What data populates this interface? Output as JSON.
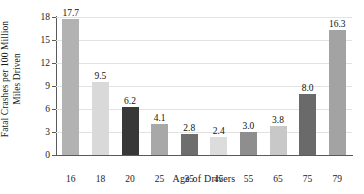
{
  "chart_data": {
    "type": "bar",
    "title": "",
    "xlabel": "Age of Drivers",
    "ylabel": "Fatal Crashes per 100 Million Miles Driven",
    "ylabel_line1": "Fatal Crashes per 100 Million",
    "ylabel_line2": "Miles Driven",
    "categories": [
      "16",
      "18",
      "20",
      "25",
      "35",
      "45",
      "55",
      "65",
      "75",
      "79"
    ],
    "values": [
      17.7,
      9.5,
      6.2,
      4.1,
      2.8,
      2.4,
      3.0,
      3.8,
      8.0,
      16.3
    ],
    "value_labels": [
      "17.7",
      "9.5",
      "6.2",
      "4.1",
      "2.8",
      "2.4",
      "3.0",
      "3.8",
      "8.0",
      "16.3"
    ],
    "bar_colors": [
      "#b2b2b2",
      "#d9d9d9",
      "#383838",
      "#a8a8a8",
      "#6e6e6e",
      "#dcdcdc",
      "#8e8e8e",
      "#c8c8c8",
      "#6a6a6a",
      "#a3a3a3"
    ],
    "ylim": [
      0,
      18
    ],
    "yticks": [
      0,
      3,
      6,
      9,
      12,
      15,
      18
    ],
    "ytick_labels": [
      "0",
      "3",
      "6",
      "9",
      "12",
      "15",
      "18"
    ],
    "grid": true,
    "grid_color": "#e2e2e2",
    "axis_color": "#5a5a5a",
    "legend": null,
    "background": "#ffffff"
  }
}
